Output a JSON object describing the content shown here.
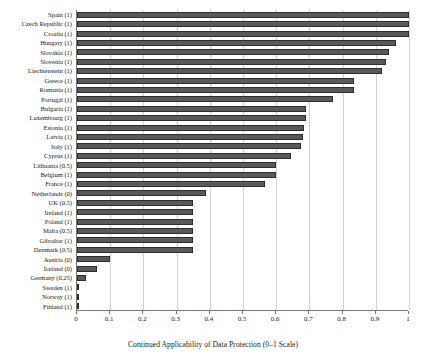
{
  "chart_data": {
    "type": "bar",
    "orientation": "horizontal",
    "title": "",
    "xlabel": "Continued Applicability of Data Protection (0–1 Scale)",
    "ylabel": "",
    "xlim": [
      0,
      1
    ],
    "xticks": [
      "0",
      "0.1",
      "0.2",
      "0.3",
      "0.4",
      "0.5",
      "0.6",
      "0.7",
      "0.8",
      "0.9",
      "1"
    ],
    "xtick_values": [
      0,
      0.1,
      0.2,
      0.3,
      0.4,
      0.5,
      0.6,
      0.7,
      0.8,
      0.9,
      1
    ],
    "grid": "vertical",
    "legend": "none",
    "bar_color": "#595959",
    "bar_edge_color": "#2e2e2e",
    "categories": [
      "Spain (1)",
      "Czech Republic (1)",
      "Croatia (1)",
      "Hungary (1)",
      "Slovakia (1)",
      "Slovenia (1)",
      "Liechtenstein (1)",
      "Greece (1)",
      "Romania (1)",
      "Portugal (1)",
      "Bulgaria (1)",
      "Luxembourg (1)",
      "Estonia (1)",
      "Latvia (1)",
      "Italy (1)",
      "Cyprus (1)",
      "Lithuania (0.5)",
      "Belgium (1)",
      "France (1)",
      "Netherlands (0)",
      "UK (0.5)",
      "Ireland (1)",
      "Poland (1)",
      "Malta (0.5)",
      "Gibraltar (1)",
      "Denmark (0.5)",
      "Austria (0)",
      "Iceland (0)",
      "Germany (0.25)",
      "Sweden (1)",
      "Norway (1)",
      "Finland (1)"
    ],
    "values": [
      1.0,
      1.0,
      1.0,
      0.96,
      0.94,
      0.93,
      0.92,
      0.835,
      0.835,
      0.77,
      0.69,
      0.69,
      0.685,
      0.68,
      0.675,
      0.645,
      0.6,
      0.6,
      0.565,
      0.39,
      0.35,
      0.35,
      0.35,
      0.35,
      0.35,
      0.35,
      0.1,
      0.06,
      0.027,
      0.0,
      0.0,
      0.0
    ]
  }
}
